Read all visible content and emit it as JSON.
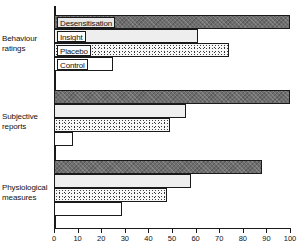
{
  "chart_data": {
    "type": "bar",
    "orientation": "horizontal",
    "title": "",
    "xlabel": "",
    "ylabel": "",
    "xlim": [
      0,
      100
    ],
    "xticks": [
      0,
      10,
      20,
      30,
      40,
      50,
      60,
      70,
      80,
      90,
      100
    ],
    "grid": false,
    "legend": "inline-on-bars",
    "categories": [
      "Behaviour ratings",
      "Subjective reports",
      "Physiological measures"
    ],
    "series": [
      {
        "name": "Desensitisation",
        "values": [
          100,
          100,
          88
        ]
      },
      {
        "name": "Insight",
        "values": [
          61,
          56,
          58
        ]
      },
      {
        "name": "Placebo",
        "values": [
          74,
          49,
          48
        ]
      },
      {
        "name": "Control",
        "values": [
          25,
          8,
          29
        ]
      }
    ]
  },
  "axis": {
    "ticks": [
      {
        "value": 0,
        "label": "0"
      },
      {
        "value": 10,
        "label": "10"
      },
      {
        "value": 20,
        "label": "20"
      },
      {
        "value": 30,
        "label": "30"
      },
      {
        "value": 40,
        "label": "40"
      },
      {
        "value": 50,
        "label": "50"
      },
      {
        "value": 60,
        "label": "60"
      },
      {
        "value": 70,
        "label": "70"
      },
      {
        "value": 80,
        "label": "80"
      },
      {
        "value": 90,
        "label": "90"
      },
      {
        "value": 100,
        "label": "100"
      }
    ]
  },
  "groups": [
    {
      "label_line1": "Behaviour",
      "label_line2": "ratings",
      "bars": [
        {
          "series": "Desensitisation",
          "label": "Desensitisation",
          "value": 100,
          "show_label": true
        },
        {
          "series": "Insight",
          "label": "Insight",
          "value": 61,
          "show_label": true
        },
        {
          "series": "Placebo",
          "label": "Placebo",
          "value": 74,
          "show_label": true
        },
        {
          "series": "Control",
          "label": "Control",
          "value": 25,
          "show_label": true
        }
      ]
    },
    {
      "label_line1": "Subjective",
      "label_line2": "reports",
      "bars": [
        {
          "series": "Desensitisation",
          "label": "",
          "value": 100,
          "show_label": false
        },
        {
          "series": "Insight",
          "label": "",
          "value": 56,
          "show_label": false
        },
        {
          "series": "Placebo",
          "label": "",
          "value": 49,
          "show_label": false
        },
        {
          "series": "Control",
          "label": "",
          "value": 8,
          "show_label": false
        }
      ]
    },
    {
      "label_line1": "Physiological",
      "label_line2": "measures",
      "bars": [
        {
          "series": "Desensitisation",
          "label": "",
          "value": 88,
          "show_label": false
        },
        {
          "series": "Insight",
          "label": "",
          "value": 58,
          "show_label": false
        },
        {
          "series": "Placebo",
          "label": "",
          "value": 48,
          "show_label": false
        },
        {
          "series": "Control",
          "label": "",
          "value": 29,
          "show_label": false
        }
      ]
    }
  ],
  "colors": {
    "desensitisation": "#6e6e6e",
    "insight": "#eeeeee",
    "placebo": "#f7f7f7",
    "control": "#ffffff",
    "outline": "#1a1a1a",
    "background": "#ffffff"
  }
}
